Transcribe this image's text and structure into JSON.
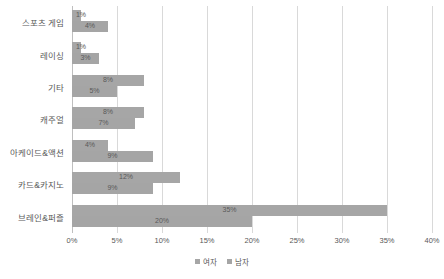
{
  "chart_data": {
    "type": "bar",
    "orientation": "horizontal",
    "title": "",
    "xlabel": "",
    "ylabel": "",
    "xlim": [
      0,
      40
    ],
    "xtick_labels": [
      "0%",
      "5%",
      "10%",
      "15%",
      "20%",
      "25%",
      "30%",
      "35%",
      "40%"
    ],
    "xtick_values": [
      0,
      5,
      10,
      15,
      20,
      25,
      30,
      35,
      40
    ],
    "grid": true,
    "legend_position": "bottom",
    "categories": [
      "스포츠 게임",
      "레이싱",
      "기타",
      "캐주얼",
      "아케이드&액션",
      "카드&카지노",
      "브레인&퍼즐"
    ],
    "series": [
      {
        "name": "여자",
        "color": "#a6a6a6",
        "values": [
          1,
          1,
          8,
          8,
          4,
          12,
          35
        ],
        "labels": [
          "1%",
          "1%",
          "8%",
          "8%",
          "4%",
          "12%",
          "35%"
        ]
      },
      {
        "name": "남자",
        "color": "#a5a5a5",
        "values": [
          4,
          3,
          5,
          7,
          9,
          9,
          20
        ],
        "labels": [
          "4%",
          "3%",
          "5%",
          "7%",
          "9%",
          "9%",
          "20%"
        ]
      }
    ]
  }
}
